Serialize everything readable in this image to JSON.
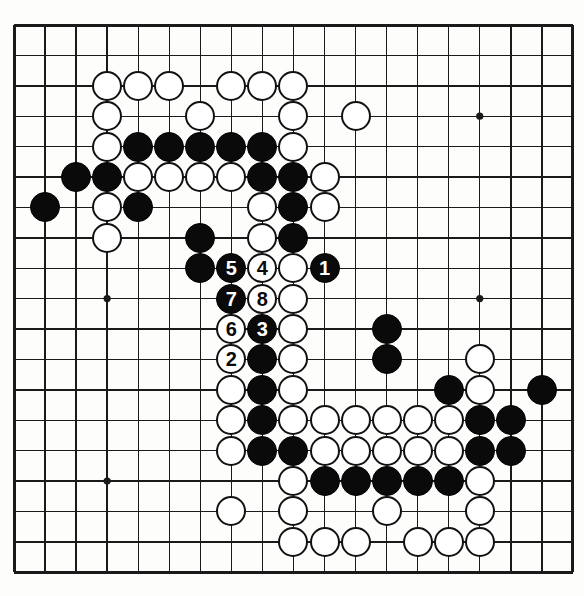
{
  "diagram": {
    "type": "go-board-diagram",
    "board_size": 19,
    "colors": {
      "board_background": "#fdfdfb",
      "grid_line": "#1a1a1a",
      "black_stone": "#0a0a0a",
      "white_stone": "#ffffff",
      "stone_outline": "#111111"
    },
    "geometry": {
      "origin_x": 14,
      "origin_y": 25,
      "step_x": 31.05,
      "step_y": 30.4,
      "stone_diameter": 30,
      "border_width": 3
    },
    "star_points": [
      {
        "col": 3,
        "row": 3
      },
      {
        "col": 9,
        "row": 3
      },
      {
        "col": 15,
        "row": 3
      },
      {
        "col": 3,
        "row": 9
      },
      {
        "col": 9,
        "row": 9
      },
      {
        "col": 15,
        "row": 9
      },
      {
        "col": 3,
        "row": 15
      },
      {
        "col": 9,
        "row": 15
      },
      {
        "col": 15,
        "row": 15
      }
    ],
    "stones": [
      {
        "col": 3,
        "row": 2,
        "color": "white",
        "label": ""
      },
      {
        "col": 4,
        "row": 2,
        "color": "white",
        "label": ""
      },
      {
        "col": 5,
        "row": 2,
        "color": "white",
        "label": ""
      },
      {
        "col": 7,
        "row": 2,
        "color": "white",
        "label": ""
      },
      {
        "col": 8,
        "row": 2,
        "color": "white",
        "label": ""
      },
      {
        "col": 9,
        "row": 2,
        "color": "white",
        "label": ""
      },
      {
        "col": 3,
        "row": 3,
        "color": "white",
        "label": ""
      },
      {
        "col": 6,
        "row": 3,
        "color": "white",
        "label": ""
      },
      {
        "col": 9,
        "row": 3,
        "color": "white",
        "label": ""
      },
      {
        "col": 11,
        "row": 3,
        "color": "white",
        "label": ""
      },
      {
        "col": 3,
        "row": 4,
        "color": "white",
        "label": ""
      },
      {
        "col": 4,
        "row": 4,
        "color": "black",
        "label": ""
      },
      {
        "col": 5,
        "row": 4,
        "color": "black",
        "label": ""
      },
      {
        "col": 6,
        "row": 4,
        "color": "black",
        "label": ""
      },
      {
        "col": 7,
        "row": 4,
        "color": "black",
        "label": ""
      },
      {
        "col": 8,
        "row": 4,
        "color": "black",
        "label": ""
      },
      {
        "col": 9,
        "row": 4,
        "color": "white",
        "label": ""
      },
      {
        "col": 2,
        "row": 5,
        "color": "black",
        "label": ""
      },
      {
        "col": 3,
        "row": 5,
        "color": "black",
        "label": ""
      },
      {
        "col": 4,
        "row": 5,
        "color": "white",
        "label": ""
      },
      {
        "col": 5,
        "row": 5,
        "color": "white",
        "label": ""
      },
      {
        "col": 6,
        "row": 5,
        "color": "white",
        "label": ""
      },
      {
        "col": 7,
        "row": 5,
        "color": "white",
        "label": ""
      },
      {
        "col": 8,
        "row": 5,
        "color": "black",
        "label": ""
      },
      {
        "col": 9,
        "row": 5,
        "color": "black",
        "label": ""
      },
      {
        "col": 10,
        "row": 5,
        "color": "white",
        "label": ""
      },
      {
        "col": 1,
        "row": 6,
        "color": "black",
        "label": ""
      },
      {
        "col": 3,
        "row": 6,
        "color": "white",
        "label": ""
      },
      {
        "col": 4,
        "row": 6,
        "color": "black",
        "label": ""
      },
      {
        "col": 8,
        "row": 6,
        "color": "white",
        "label": ""
      },
      {
        "col": 9,
        "row": 6,
        "color": "black",
        "label": ""
      },
      {
        "col": 10,
        "row": 6,
        "color": "white",
        "label": ""
      },
      {
        "col": 3,
        "row": 7,
        "color": "white",
        "label": ""
      },
      {
        "col": 6,
        "row": 7,
        "color": "black",
        "label": ""
      },
      {
        "col": 8,
        "row": 7,
        "color": "white",
        "label": ""
      },
      {
        "col": 9,
        "row": 7,
        "color": "black",
        "label": ""
      },
      {
        "col": 6,
        "row": 8,
        "color": "black",
        "label": ""
      },
      {
        "col": 7,
        "row": 8,
        "color": "black",
        "label": "5"
      },
      {
        "col": 8,
        "row": 8,
        "color": "white",
        "label": "4"
      },
      {
        "col": 9,
        "row": 8,
        "color": "white",
        "label": ""
      },
      {
        "col": 10,
        "row": 8,
        "color": "black",
        "label": "1"
      },
      {
        "col": 7,
        "row": 9,
        "color": "black",
        "label": "7"
      },
      {
        "col": 8,
        "row": 9,
        "color": "white",
        "label": "8"
      },
      {
        "col": 9,
        "row": 9,
        "color": "white",
        "label": ""
      },
      {
        "col": 7,
        "row": 10,
        "color": "white",
        "label": "6"
      },
      {
        "col": 8,
        "row": 10,
        "color": "black",
        "label": "3"
      },
      {
        "col": 9,
        "row": 10,
        "color": "white",
        "label": ""
      },
      {
        "col": 12,
        "row": 10,
        "color": "black",
        "label": ""
      },
      {
        "col": 7,
        "row": 11,
        "color": "white",
        "label": "2"
      },
      {
        "col": 8,
        "row": 11,
        "color": "black",
        "label": ""
      },
      {
        "col": 9,
        "row": 11,
        "color": "white",
        "label": ""
      },
      {
        "col": 12,
        "row": 11,
        "color": "black",
        "label": ""
      },
      {
        "col": 15,
        "row": 11,
        "color": "white",
        "label": ""
      },
      {
        "col": 7,
        "row": 12,
        "color": "white",
        "label": ""
      },
      {
        "col": 8,
        "row": 12,
        "color": "black",
        "label": ""
      },
      {
        "col": 9,
        "row": 12,
        "color": "white",
        "label": ""
      },
      {
        "col": 14,
        "row": 12,
        "color": "black",
        "label": ""
      },
      {
        "col": 15,
        "row": 12,
        "color": "white",
        "label": ""
      },
      {
        "col": 17,
        "row": 12,
        "color": "black",
        "label": ""
      },
      {
        "col": 7,
        "row": 13,
        "color": "white",
        "label": ""
      },
      {
        "col": 8,
        "row": 13,
        "color": "black",
        "label": ""
      },
      {
        "col": 9,
        "row": 13,
        "color": "white",
        "label": ""
      },
      {
        "col": 10,
        "row": 13,
        "color": "white",
        "label": ""
      },
      {
        "col": 11,
        "row": 13,
        "color": "white",
        "label": ""
      },
      {
        "col": 12,
        "row": 13,
        "color": "white",
        "label": ""
      },
      {
        "col": 13,
        "row": 13,
        "color": "white",
        "label": ""
      },
      {
        "col": 14,
        "row": 13,
        "color": "white",
        "label": ""
      },
      {
        "col": 15,
        "row": 13,
        "color": "black",
        "label": ""
      },
      {
        "col": 16,
        "row": 13,
        "color": "black",
        "label": ""
      },
      {
        "col": 7,
        "row": 14,
        "color": "white",
        "label": ""
      },
      {
        "col": 8,
        "row": 14,
        "color": "black",
        "label": ""
      },
      {
        "col": 9,
        "row": 14,
        "color": "black",
        "label": ""
      },
      {
        "col": 10,
        "row": 14,
        "color": "white",
        "label": ""
      },
      {
        "col": 11,
        "row": 14,
        "color": "white",
        "label": ""
      },
      {
        "col": 12,
        "row": 14,
        "color": "white",
        "label": ""
      },
      {
        "col": 13,
        "row": 14,
        "color": "white",
        "label": ""
      },
      {
        "col": 14,
        "row": 14,
        "color": "white",
        "label": ""
      },
      {
        "col": 15,
        "row": 14,
        "color": "black",
        "label": ""
      },
      {
        "col": 16,
        "row": 14,
        "color": "black",
        "label": ""
      },
      {
        "col": 9,
        "row": 15,
        "color": "white",
        "label": ""
      },
      {
        "col": 10,
        "row": 15,
        "color": "black",
        "label": ""
      },
      {
        "col": 11,
        "row": 15,
        "color": "black",
        "label": ""
      },
      {
        "col": 12,
        "row": 15,
        "color": "black",
        "label": ""
      },
      {
        "col": 13,
        "row": 15,
        "color": "black",
        "label": ""
      },
      {
        "col": 14,
        "row": 15,
        "color": "black",
        "label": ""
      },
      {
        "col": 15,
        "row": 15,
        "color": "white",
        "label": ""
      },
      {
        "col": 7,
        "row": 16,
        "color": "white",
        "label": ""
      },
      {
        "col": 9,
        "row": 16,
        "color": "white",
        "label": ""
      },
      {
        "col": 12,
        "row": 16,
        "color": "white",
        "label": ""
      },
      {
        "col": 15,
        "row": 16,
        "color": "white",
        "label": ""
      },
      {
        "col": 9,
        "row": 17,
        "color": "white",
        "label": ""
      },
      {
        "col": 10,
        "row": 17,
        "color": "white",
        "label": ""
      },
      {
        "col": 11,
        "row": 17,
        "color": "white",
        "label": ""
      },
      {
        "col": 13,
        "row": 17,
        "color": "white",
        "label": ""
      },
      {
        "col": 14,
        "row": 17,
        "color": "white",
        "label": ""
      },
      {
        "col": 15,
        "row": 17,
        "color": "white",
        "label": ""
      }
    ],
    "move_sequence": [
      {
        "number": "1",
        "color": "black",
        "col": 10,
        "row": 8
      },
      {
        "number": "2",
        "color": "white",
        "col": 7,
        "row": 11
      },
      {
        "number": "3",
        "color": "black",
        "col": 8,
        "row": 10
      },
      {
        "number": "4",
        "color": "white",
        "col": 8,
        "row": 8
      },
      {
        "number": "5",
        "color": "black",
        "col": 7,
        "row": 8
      },
      {
        "number": "6",
        "color": "white",
        "col": 7,
        "row": 10
      },
      {
        "number": "7",
        "color": "black",
        "col": 7,
        "row": 9
      },
      {
        "number": "8",
        "color": "white",
        "col": 8,
        "row": 9
      }
    ]
  }
}
